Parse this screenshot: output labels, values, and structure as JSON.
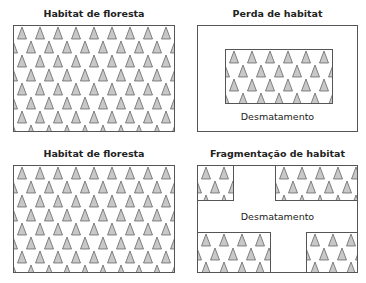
{
  "panels": [
    {
      "id": "forest-1",
      "title": "Habitat de floresta"
    },
    {
      "id": "loss",
      "title": "Perda de habitat",
      "label": "Desmatamento"
    },
    {
      "id": "forest-2",
      "title": "Habitat de floresta"
    },
    {
      "id": "fragmentation",
      "title": "Fragmentação de habitat",
      "label": "Desmatamento"
    }
  ],
  "colors": {
    "tree_fill": "#c8c8c8",
    "tree_stroke": "#555555",
    "border": "#555555"
  }
}
